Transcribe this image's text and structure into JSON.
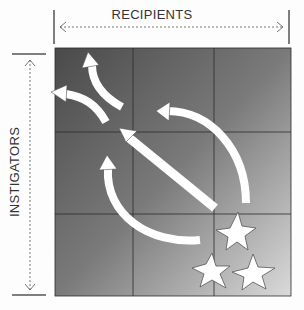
{
  "diagram": {
    "x_axis_label": "RECIPIENTS",
    "y_axis_label": "INSTIGATORS",
    "grid": {
      "rows": 3,
      "cols": 3
    },
    "elements": [
      {
        "type": "burst",
        "count": 3,
        "position": "bottom-right"
      },
      {
        "type": "arrow",
        "direction": "to top-left",
        "shape": "straight diagonal"
      },
      {
        "type": "arrow",
        "direction": "up then left",
        "shape": "curved, right side"
      },
      {
        "type": "arrow",
        "direction": "up",
        "shape": "curved, left side"
      },
      {
        "type": "arrow",
        "direction": "split to top and left",
        "shape": "forked at top-left"
      }
    ],
    "colors": {
      "dark": "#555555",
      "light": "#d6d6d6",
      "arrow": "#ffffff",
      "grid_line": "#333333"
    }
  }
}
